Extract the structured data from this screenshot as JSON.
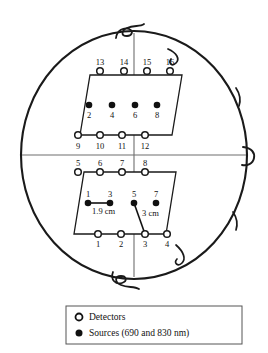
{
  "figure": {
    "title": "",
    "type": "probe-placement-diagram",
    "head_outline": {
      "cx": 134,
      "cy": 155,
      "rx": 113,
      "ry": 124,
      "stroke": "#1a1a1a",
      "stroke_width": 2.1,
      "midline_vertical": true,
      "midline_horizontal": true,
      "midline_color": "#6e6e6e"
    },
    "upper_pad": {
      "name": "upper-probe-pad",
      "points": "90,75 182,75 172,135 80,135",
      "stroke": "#1a1a1a",
      "stroke_width": 1.3,
      "fill": "#ffffff"
    },
    "lower_pad": {
      "name": "lower-probe-pad",
      "points": "84,172 176,172 166,234 74,234",
      "stroke": "#1a1a1a",
      "stroke_width": 1.3,
      "fill": "#ffffff"
    },
    "detectors": [
      {
        "id": "13",
        "x": 100,
        "y": 71,
        "label_pos": "above"
      },
      {
        "id": "14",
        "x": 124,
        "y": 71,
        "label_pos": "above"
      },
      {
        "id": "15",
        "x": 147,
        "y": 71,
        "label_pos": "above"
      },
      {
        "id": "16",
        "x": 170,
        "y": 71,
        "label_pos": "above"
      },
      {
        "id": "9",
        "x": 78,
        "y": 135,
        "label_pos": "below"
      },
      {
        "id": "10",
        "x": 100,
        "y": 135,
        "label_pos": "below"
      },
      {
        "id": "11",
        "x": 122,
        "y": 135,
        "label_pos": "below"
      },
      {
        "id": "12",
        "x": 145,
        "y": 135,
        "label_pos": "below"
      },
      {
        "id": "5",
        "x": 78,
        "y": 172,
        "label_pos": "above"
      },
      {
        "id": "6",
        "x": 100,
        "y": 172,
        "label_pos": "above"
      },
      {
        "id": "7",
        "x": 122,
        "y": 172,
        "label_pos": "above"
      },
      {
        "id": "8",
        "x": 145,
        "y": 172,
        "label_pos": "above"
      },
      {
        "id": "1",
        "x": 98,
        "y": 234,
        "label_pos": "below"
      },
      {
        "id": "2",
        "x": 121,
        "y": 234,
        "label_pos": "below"
      },
      {
        "id": "3",
        "x": 145,
        "y": 234,
        "label_pos": "below"
      },
      {
        "id": "4",
        "x": 167,
        "y": 234,
        "label_pos": "below"
      }
    ],
    "sources": [
      {
        "id": "2",
        "x": 89,
        "y": 105,
        "label_pos": "below"
      },
      {
        "id": "4",
        "x": 112,
        "y": 105,
        "label_pos": "below"
      },
      {
        "id": "6",
        "x": 135,
        "y": 105,
        "label_pos": "below"
      },
      {
        "id": "8",
        "x": 157,
        "y": 105,
        "label_pos": "below"
      },
      {
        "id": "1",
        "x": 88,
        "y": 203,
        "label_pos": "above"
      },
      {
        "id": "3",
        "x": 110,
        "y": 203,
        "label_pos": "above"
      },
      {
        "id": "5",
        "x": 134,
        "y": 203,
        "label_pos": "above"
      },
      {
        "id": "7",
        "x": 156,
        "y": 203,
        "label_pos": "above"
      }
    ],
    "annotations": [
      {
        "name": "source-separation-1-9cm",
        "text": "1.9 cm",
        "line": {
          "x1": 88,
          "y1": 203,
          "x2": 110,
          "y2": 203
        },
        "text_x": 92,
        "text_y": 214
      },
      {
        "name": "source-detector-separation-3cm",
        "text": "3 cm",
        "line": {
          "x1": 134,
          "y1": 203,
          "x2": 145,
          "y2": 234
        },
        "text_x": 142,
        "text_y": 216
      }
    ],
    "markers": {
      "detector_radius": 3.3,
      "detector_fill": "#ffffff",
      "detector_stroke": "#1a1a1a",
      "source_radius": 3.3,
      "source_fill": "#111111"
    }
  },
  "legend": {
    "box": {
      "x": 66,
      "y": 306,
      "width": 176,
      "height": 38,
      "stroke": "#555555",
      "fill": "#ffffff"
    },
    "items": [
      {
        "symbol": "detector",
        "label": "Detectors"
      },
      {
        "symbol": "source",
        "label": "Sources (690 and 830 nm)"
      }
    ]
  }
}
